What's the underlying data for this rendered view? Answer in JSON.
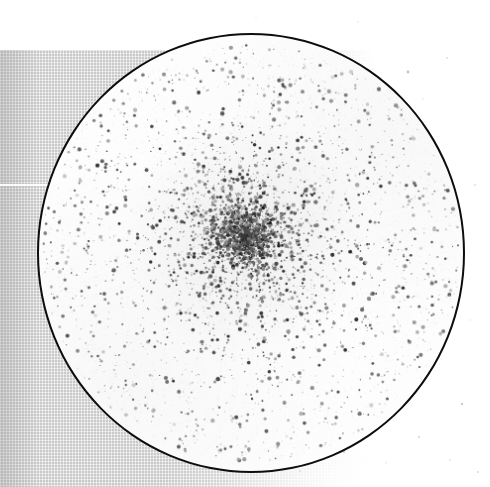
{
  "image": {
    "subject": "globular-star-cluster",
    "medium": "scanned photographic plate",
    "caption": "Globular star cluster imaged within a circular telescope field aperture on a scanned photographic plate",
    "width": 490,
    "height": 487,
    "background_color": "#ffffff"
  },
  "backing": {
    "name": "halftone scan backing",
    "color": "#c9c9c9",
    "left": 0,
    "top": 50,
    "width": 378,
    "height": 437,
    "texture": "fine orthogonal halftone grid",
    "seam": {
      "name": "horizontal scan seam",
      "color": "#ffffff",
      "top": 184,
      "height": 2
    }
  },
  "aperture": {
    "name": "circular field aperture",
    "shape": "circle",
    "center_x": 251,
    "center_y": 253,
    "radius": 214,
    "left": 37,
    "top": 33,
    "width": 428,
    "height": 440,
    "outline_color": "#0d0d0d",
    "outline_width": 2,
    "fill_color": "#fdfdfd"
  },
  "cluster": {
    "name": "globular cluster core",
    "center_x": 246,
    "center_y": 236,
    "core_radius": 26,
    "halo_radius": 95,
    "star_color": "#1a1a1a",
    "faint_star_color": "#8a8a8a"
  },
  "starfield": {
    "total_stars": 4200,
    "core_stars": 900,
    "halo_stars": 1400,
    "field_stars": 1900,
    "min_radius_px": 0.45,
    "max_radius_px": 2.2,
    "seed": 20240517
  },
  "outside_specks": {
    "count": 14,
    "color": "#bdbdbd",
    "points": [
      {
        "x": 408,
        "y": 72,
        "r": 1.4,
        "a": 0.45
      },
      {
        "x": 447,
        "y": 58,
        "r": 0.9,
        "a": 0.25
      },
      {
        "x": 423,
        "y": 99,
        "r": 0.8,
        "a": 0.2
      },
      {
        "x": 475,
        "y": 185,
        "r": 1.0,
        "a": 0.22
      },
      {
        "x": 462,
        "y": 404,
        "r": 1.3,
        "a": 0.35
      },
      {
        "x": 419,
        "y": 437,
        "r": 1.1,
        "a": 0.3
      },
      {
        "x": 450,
        "y": 460,
        "r": 0.9,
        "a": 0.22
      },
      {
        "x": 478,
        "y": 472,
        "r": 1.0,
        "a": 0.26
      },
      {
        "x": 386,
        "y": 463,
        "r": 0.8,
        "a": 0.2
      },
      {
        "x": 344,
        "y": 452,
        "r": 1.2,
        "a": 0.3
      },
      {
        "x": 300,
        "y": 471,
        "r": 0.9,
        "a": 0.22
      },
      {
        "x": 358,
        "y": 22,
        "r": 0.8,
        "a": 0.18
      },
      {
        "x": 256,
        "y": 18,
        "r": 0.7,
        "a": 0.16
      },
      {
        "x": 470,
        "y": 320,
        "r": 0.8,
        "a": 0.18
      }
    ]
  }
}
